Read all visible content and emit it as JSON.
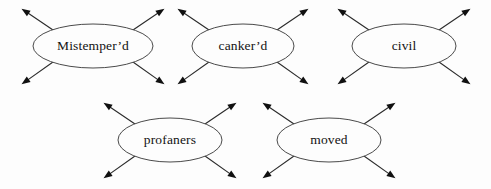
{
  "figure": {
    "type": "node-radial-arrow-diagram",
    "background_color": "#fdfdfd",
    "stroke_color": "#4a4a4a",
    "arrow_color": "#101010",
    "text_color": "#121212",
    "node_count": 5,
    "arrows_per_node": 4,
    "arrow_directions": [
      "northwest",
      "northeast",
      "southwest",
      "southeast"
    ]
  },
  "nodes": [
    {
      "id": "node-mistemperd",
      "label": "Mistemper’d",
      "row": "top",
      "cx": 93,
      "cy": 46,
      "rx": 60,
      "ry": 22,
      "arrows": [
        {
          "dir": "northwest",
          "x1": 53,
          "y1": 30,
          "x2": 22,
          "y2": 9
        },
        {
          "dir": "northeast",
          "x1": 133,
          "y1": 30,
          "x2": 164,
          "y2": 9
        },
        {
          "dir": "southwest",
          "x1": 53,
          "y1": 62,
          "x2": 22,
          "y2": 84
        },
        {
          "dir": "southeast",
          "x1": 133,
          "y1": 62,
          "x2": 164,
          "y2": 84
        }
      ]
    },
    {
      "id": "node-cankerd",
      "label": "canker’d",
      "row": "top",
      "cx": 243,
      "cy": 46,
      "rx": 51,
      "ry": 22,
      "arrows": [
        {
          "dir": "northwest",
          "x1": 209,
          "y1": 30,
          "x2": 178,
          "y2": 9
        },
        {
          "dir": "northeast",
          "x1": 277,
          "y1": 30,
          "x2": 308,
          "y2": 9
        },
        {
          "dir": "southwest",
          "x1": 209,
          "y1": 62,
          "x2": 178,
          "y2": 84
        },
        {
          "dir": "southeast",
          "x1": 277,
          "y1": 62,
          "x2": 308,
          "y2": 84
        }
      ]
    },
    {
      "id": "node-civil",
      "label": "civil",
      "row": "top",
      "cx": 404,
      "cy": 46,
      "rx": 52,
      "ry": 22,
      "arrows": [
        {
          "dir": "northwest",
          "x1": 369,
          "y1": 30,
          "x2": 338,
          "y2": 9
        },
        {
          "dir": "northeast",
          "x1": 439,
          "y1": 30,
          "x2": 470,
          "y2": 9
        },
        {
          "dir": "southwest",
          "x1": 369,
          "y1": 62,
          "x2": 338,
          "y2": 84
        },
        {
          "dir": "southeast",
          "x1": 439,
          "y1": 62,
          "x2": 470,
          "y2": 84
        }
      ]
    },
    {
      "id": "node-profaners",
      "label": "profaners",
      "row": "bottom",
      "cx": 170,
      "cy": 140,
      "rx": 52,
      "ry": 22,
      "arrows": [
        {
          "dir": "northwest",
          "x1": 135,
          "y1": 124,
          "x2": 104,
          "y2": 103
        },
        {
          "dir": "northeast",
          "x1": 205,
          "y1": 124,
          "x2": 236,
          "y2": 103
        },
        {
          "dir": "southwest",
          "x1": 135,
          "y1": 156,
          "x2": 104,
          "y2": 178
        },
        {
          "dir": "southeast",
          "x1": 205,
          "y1": 156,
          "x2": 236,
          "y2": 178
        }
      ]
    },
    {
      "id": "node-moved",
      "label": "moved",
      "row": "bottom",
      "cx": 329,
      "cy": 140,
      "rx": 52,
      "ry": 22,
      "arrows": [
        {
          "dir": "northwest",
          "x1": 294,
          "y1": 124,
          "x2": 263,
          "y2": 103
        },
        {
          "dir": "northeast",
          "x1": 364,
          "y1": 124,
          "x2": 395,
          "y2": 103
        },
        {
          "dir": "southwest",
          "x1": 294,
          "y1": 156,
          "x2": 263,
          "y2": 178
        },
        {
          "dir": "southeast",
          "x1": 364,
          "y1": 156,
          "x2": 395,
          "y2": 178
        }
      ]
    }
  ]
}
